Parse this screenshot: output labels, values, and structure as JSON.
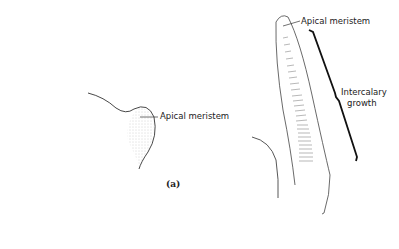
{
  "figure": {
    "panel_a": {
      "caption": "(a)",
      "label": "Apical meristem"
    },
    "panel_b": {
      "apical_label": "Apical meristem",
      "bracket_label_line1": "Intercalary",
      "bracket_label_line2": "growth"
    }
  },
  "colors": {
    "line": "#333333",
    "stipple": "#888888",
    "bracket": "#111111"
  }
}
